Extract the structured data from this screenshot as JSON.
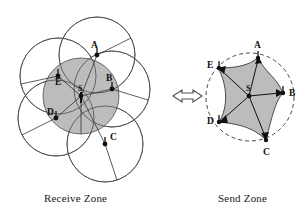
{
  "figure": {
    "title": "",
    "captions": {
      "left": "Receive Zone",
      "right": "Send Zone"
    },
    "relation_symbol": "double-headed-arrow"
  },
  "colors": {
    "zone_fill": "#bcbcbc",
    "stroke": "#4a4a4a",
    "node": "#111111",
    "background": "#ffffff"
  },
  "receive_zone": {
    "label": "Receive Zone",
    "center_node": {
      "id": "S",
      "label": "S",
      "x": 81,
      "y": 96
    },
    "nodes": [
      {
        "id": "A",
        "label": "A",
        "x": 97,
        "y": 55
      },
      {
        "id": "B",
        "label": "B",
        "x": 112,
        "y": 89
      },
      {
        "id": "C",
        "label": "C",
        "x": 105,
        "y": 144
      },
      {
        "id": "D",
        "label": "D",
        "x": 56,
        "y": 118
      },
      {
        "id": "E",
        "label": "E",
        "x": 58,
        "y": 76
      }
    ],
    "circle_radius": 38,
    "filled_circle_center": "S",
    "circle_count": 6,
    "description_text": ""
  },
  "send_zone": {
    "label": "Send Zone",
    "center_node": {
      "id": "S",
      "label": "S",
      "x": 249,
      "y": 96
    },
    "nodes": [
      {
        "id": "A",
        "label": "A",
        "x": 258,
        "y": 57
      },
      {
        "id": "B",
        "label": "B",
        "x": 283,
        "y": 93
      },
      {
        "id": "C",
        "label": "C",
        "x": 266,
        "y": 140
      },
      {
        "id": "D",
        "label": "D",
        "x": 219,
        "y": 122
      },
      {
        "id": "E",
        "label": "E",
        "x": 218,
        "y": 68
      }
    ],
    "boundary_style": "dashed-circle",
    "boundary_radius": 44
  }
}
